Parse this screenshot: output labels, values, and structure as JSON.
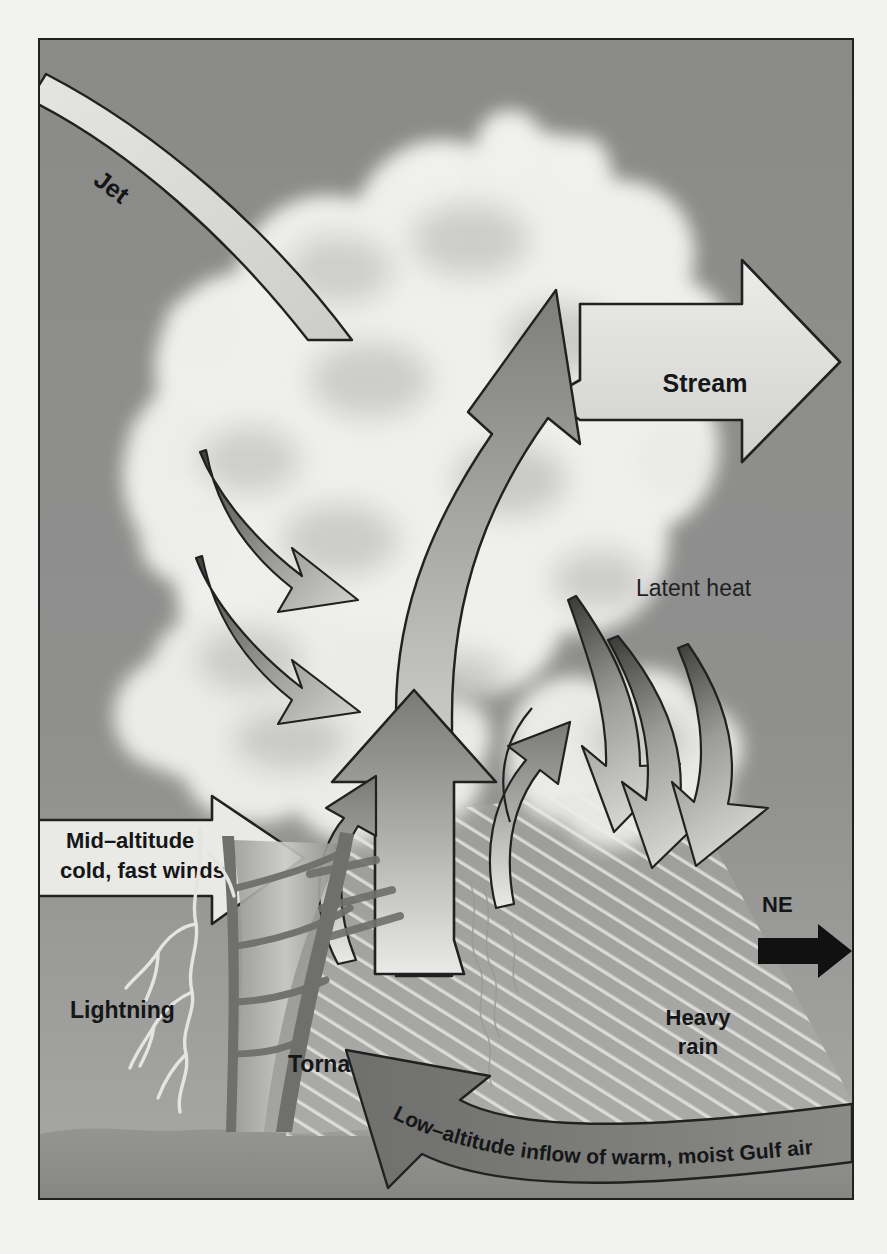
{
  "figure": {
    "background_sky_color": "#8e8e8e",
    "cloud_color": "#f4f4f2",
    "ground_color": "#8d8d8b",
    "outline_color": "#1d1e1c",
    "arrow_fill_light": "#ededea",
    "arrow_fill_gray": "#8a8a88",
    "accent_black": "#0d0d0d"
  },
  "labels": {
    "jet": "Jet",
    "stream": "Stream",
    "thermal_updraft": "Thermal Updraft",
    "latent_heat": "Latent heat",
    "mid_altitude_line1": "Mid–altitude",
    "mid_altitude_line2": "cold, fast winds",
    "lightning": "Lightning",
    "tornado": "Tornado",
    "heavy_rain_line1": "Heavy",
    "heavy_rain_line2": "rain",
    "low_altitude_inflow": "Low–altitude inflow of warm, moist Gulf air",
    "compass_direction": "NE"
  },
  "elements": {
    "jet_band": "jet-stream-band",
    "stream_arrow": "stream-arrow",
    "updraft_curved_arrow": "thermal-updraft-arrow",
    "downdraft_arrows": "upper-level-downdraft-arrows",
    "latent_heat_arrows": "latent-heat-descending-arrows",
    "main_updraft_arrow": "main-updraft-arrow",
    "inflow_arrow": "low-altitude-inflow-arrow",
    "mid_altitude_arrow": "mid-altitude-wind-arrow",
    "compass_arrow": "compass-ne-arrow",
    "tornado_funnel": "tornado-funnel",
    "lightning_bolt": "lightning-bolt",
    "rain_shaft": "heavy-rain-shaft",
    "ground": "ground-terrain"
  }
}
